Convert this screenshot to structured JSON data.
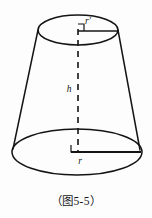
{
  "figure": {
    "name": "frustum-of-cone-diagram",
    "shape": "truncated cone (frustum)",
    "background_color": "#fdfdfd",
    "stroke_color": "#141414",
    "labels": {
      "top_radius": "r′",
      "height": "h",
      "bottom_radius": "r"
    },
    "geometry": {
      "top_ellipse": {
        "cx": 78,
        "cy": 30,
        "rx": 40,
        "ry": 15
      },
      "bottom_ellipse": {
        "cx": 77,
        "cy": 152,
        "rx": 65,
        "ry": 23
      },
      "axis": {
        "x": 78,
        "y_top": 30,
        "y_bottom": 152
      },
      "top_radius_line": {
        "x1": 78,
        "y1": 31,
        "x2": 118,
        "y2": 31
      },
      "bottom_radius_line": {
        "x1": 78,
        "y1": 152,
        "x2": 141,
        "y2": 152
      },
      "left_slant": {
        "x1": 38,
        "y1": 30,
        "x2": 13,
        "y2": 149
      },
      "right_slant": {
        "x1": 118,
        "y1": 30,
        "x2": 140,
        "y2": 150
      }
    },
    "label_positions": {
      "top_radius": {
        "x": 88,
        "y": 24
      },
      "height": {
        "x": 69,
        "y": 92
      },
      "bottom_radius": {
        "x": 80,
        "y": 164
      }
    }
  },
  "caption": {
    "text": "（图5-5）",
    "number": "5-5"
  }
}
